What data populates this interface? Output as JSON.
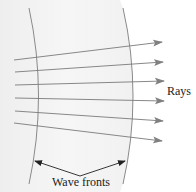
{
  "diagram": {
    "title": "",
    "labels": {
      "rays": "Rays",
      "wave_fronts": "Wave fronts"
    },
    "elements": {
      "wave_fronts": [
        {
          "name": "left-wave-front",
          "shape": "arc",
          "path": "M29,8 Q48,96 29,184"
        },
        {
          "name": "right-wave-front",
          "shape": "arc",
          "path": "M123,8 Q143,96 123,184"
        }
      ],
      "rays": [
        {
          "from": [
            14,
            60
          ],
          "to": [
            162,
            42
          ]
        },
        {
          "from": [
            15,
            72
          ],
          "to": [
            163,
            62
          ]
        },
        {
          "from": [
            15,
            85
          ],
          "to": [
            164,
            81
          ]
        },
        {
          "from": [
            15,
            98
          ],
          "to": [
            164,
            101
          ]
        },
        {
          "from": [
            15,
            111
          ],
          "to": [
            163,
            121
          ]
        },
        {
          "from": [
            14,
            123
          ],
          "to": [
            162,
            141
          ]
        }
      ],
      "pointer_arrows": [
        {
          "from": [
            80,
            176
          ],
          "to": [
            35,
            161
          ]
        },
        {
          "from": [
            80,
            176
          ],
          "to": [
            125,
            161
          ]
        }
      ]
    },
    "colors": {
      "background": "#ffffff",
      "shaded_region": "#f2f2f2",
      "wave_front_stroke": "#8a8a8a",
      "ray_stroke": "#7a7a7a",
      "ray_arrowhead": "#808080",
      "pointer_arrow": "#222222",
      "text": "#222222"
    }
  }
}
